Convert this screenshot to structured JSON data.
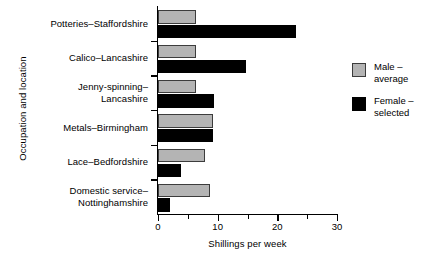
{
  "chart_data": {
    "type": "bar",
    "orientation": "horizontal",
    "title": "",
    "xlabel": "Shillings per week",
    "ylabel": "Occupation and location",
    "xlim": [
      0,
      30
    ],
    "xticks": [
      0,
      10,
      20,
      30
    ],
    "xtick_labels": [
      "0",
      "10",
      "20",
      "30"
    ],
    "xminorticks": [
      5,
      15,
      25
    ],
    "grid": false,
    "legend_position": "right",
    "categories": [
      "Potteries–Staffordshire",
      "Calico–Lancashire",
      "Jenny-spinning–\nLancashire",
      "Metals–Birmingham",
      "Lace–Bedfordshire",
      "Domestic service–\nNottinghamshire"
    ],
    "series": [
      {
        "name": "Male –\naverage",
        "color": "#b4b4b4",
        "values": [
          6.4,
          6.4,
          6.4,
          9.2,
          7.9,
          8.7
        ]
      },
      {
        "name": "Female –\nselected",
        "color": "#000000",
        "values": [
          23.1,
          14.7,
          9.4,
          9.2,
          3.9,
          2.0
        ]
      }
    ]
  },
  "legend": {
    "items": [
      {
        "label": "Male –\naverage",
        "color": "#b4b4b4"
      },
      {
        "label": "Female –\nselected",
        "color": "#000000"
      }
    ]
  }
}
